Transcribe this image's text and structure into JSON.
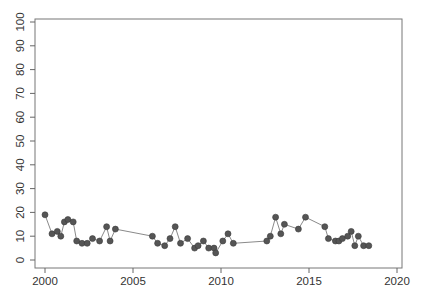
{
  "chart_data": {
    "type": "line",
    "title": "",
    "xlabel": "",
    "ylabel": "",
    "xlim": [
      2000,
      2020
    ],
    "ylim": [
      0,
      100
    ],
    "grid": false,
    "legend": null,
    "x_ticks": [
      2000,
      2005,
      2010,
      2015,
      2020
    ],
    "y_ticks": [
      0,
      10,
      20,
      30,
      40,
      50,
      60,
      70,
      80,
      90,
      100
    ],
    "marker": "filled-circle",
    "colors": {
      "marker": "#555555",
      "line": "#8a8a8a",
      "axis": "#666666"
    },
    "series": [
      {
        "name": "series",
        "points": [
          [
            2000.0,
            19
          ],
          [
            2000.4,
            11
          ],
          [
            2000.7,
            12
          ],
          [
            2000.9,
            10
          ],
          [
            2001.1,
            16
          ],
          [
            2001.3,
            17
          ],
          [
            2001.6,
            16
          ],
          [
            2001.8,
            8
          ],
          [
            2002.1,
            7
          ],
          [
            2002.4,
            7
          ],
          [
            2002.7,
            9
          ],
          [
            2003.1,
            8
          ],
          [
            2003.5,
            14
          ],
          [
            2003.7,
            8
          ],
          [
            2004.0,
            13
          ],
          [
            2006.1,
            10
          ],
          [
            2006.4,
            7
          ],
          [
            2006.8,
            6
          ],
          [
            2007.1,
            9
          ],
          [
            2007.4,
            14
          ],
          [
            2007.7,
            7
          ],
          [
            2008.1,
            9
          ],
          [
            2008.5,
            5
          ],
          [
            2008.7,
            6
          ],
          [
            2009.0,
            8
          ],
          [
            2009.3,
            5
          ],
          [
            2009.6,
            5
          ],
          [
            2009.7,
            3
          ],
          [
            2010.1,
            8
          ],
          [
            2010.4,
            11
          ],
          [
            2010.7,
            7
          ],
          [
            2012.6,
            8
          ],
          [
            2012.8,
            10
          ],
          [
            2013.1,
            18
          ],
          [
            2013.4,
            11
          ],
          [
            2013.6,
            15
          ],
          [
            2014.4,
            13
          ],
          [
            2014.8,
            18
          ],
          [
            2015.9,
            14
          ],
          [
            2016.1,
            9
          ],
          [
            2016.5,
            8
          ],
          [
            2016.7,
            8
          ],
          [
            2016.9,
            9
          ],
          [
            2017.2,
            10
          ],
          [
            2017.4,
            12
          ],
          [
            2017.6,
            6
          ],
          [
            2017.8,
            10
          ],
          [
            2018.1,
            6
          ],
          [
            2018.4,
            6
          ]
        ]
      }
    ]
  }
}
